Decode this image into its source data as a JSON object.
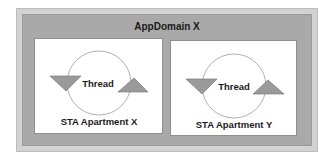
{
  "diagram": {
    "container": {
      "title": "AppDomain X"
    },
    "apartments": [
      {
        "label": "STA Apartment X",
        "thread": {
          "label": "Thread"
        }
      },
      {
        "label": "STA Apartment Y",
        "thread": {
          "label": "Thread"
        }
      }
    ],
    "colors": {
      "outer_border": "#d2d2d2",
      "appdomain_fill": "#a9a9a9",
      "apartment_fill": "#ffffff",
      "triangle_fill": "#9a9a9a",
      "triangle_stroke": "#6e6e6e",
      "circle_stroke": "#9a9a9a",
      "text": "#1a1a1a"
    }
  }
}
